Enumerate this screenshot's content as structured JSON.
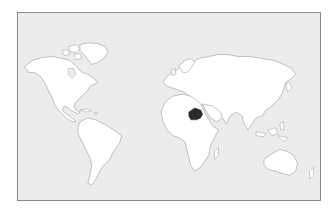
{
  "map": {
    "type": "world-locator-map",
    "projection": "equirectangular-like",
    "background_color": "#ececec",
    "land_color": "#ffffff",
    "border_color": "#9a9a9a",
    "frame_color": "#8a8a8a",
    "highlighted_region": {
      "name": "Ethiopia",
      "color": "#2a2a2a"
    },
    "continents": [
      "North America",
      "South America",
      "Europe",
      "Asia",
      "Africa",
      "Australia"
    ]
  }
}
